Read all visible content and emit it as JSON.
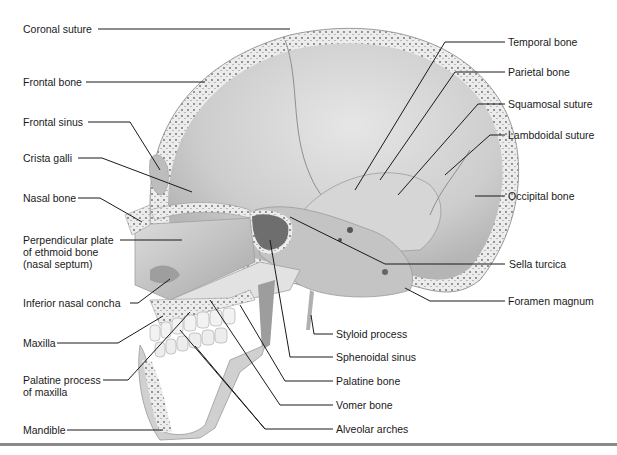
{
  "figure": {
    "colors": {
      "bone_light": "#e9e9e9",
      "bone_mid": "#cfcfcf",
      "bone_dark": "#9a9a9a",
      "leader_line": "#1a1a1a",
      "bottom_rule": "#8a8a8a"
    }
  },
  "labels_left": [
    {
      "id": "coronal-suture",
      "text": "Coronal suture"
    },
    {
      "id": "frontal-bone",
      "text": "Frontal bone"
    },
    {
      "id": "frontal-sinus",
      "text": "Frontal sinus"
    },
    {
      "id": "crista-galli",
      "text": "Crista galli"
    },
    {
      "id": "nasal-bone",
      "text": "Nasal bone"
    },
    {
      "id": "perpendicular-plate",
      "text": "Perpendicular plate\nof ethmoid bone\n(nasal septum)"
    },
    {
      "id": "inferior-nasal-concha",
      "text": "Inferior nasal concha"
    },
    {
      "id": "maxilla",
      "text": "Maxilla"
    },
    {
      "id": "palatine-process",
      "text": "Palatine process\nof maxilla"
    },
    {
      "id": "mandible",
      "text": "Mandible"
    }
  ],
  "labels_right": [
    {
      "id": "temporal-bone",
      "text": "Temporal bone"
    },
    {
      "id": "parietal-bone",
      "text": "Parietal bone"
    },
    {
      "id": "squamosal-suture",
      "text": "Squamosal suture"
    },
    {
      "id": "lambdoidal-suture",
      "text": "Lambdoidal suture"
    },
    {
      "id": "occipital-bone",
      "text": "Occipital bone"
    },
    {
      "id": "sella-turcica",
      "text": "Sella turcica"
    },
    {
      "id": "foramen-magnum",
      "text": "Foramen magnum"
    }
  ],
  "labels_bottom": [
    {
      "id": "styloid-process",
      "text": "Styloid process"
    },
    {
      "id": "sphenoidal-sinus",
      "text": "Sphenoidal sinus"
    },
    {
      "id": "palatine-bone",
      "text": "Palatine bone"
    },
    {
      "id": "vomer-bone",
      "text": "Vomer bone"
    },
    {
      "id": "alveolar-arches",
      "text": "Alveolar arches"
    }
  ]
}
